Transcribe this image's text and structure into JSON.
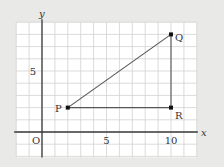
{
  "diagram": {
    "type": "coordinate-grid-triangle",
    "axes": {
      "x_label": "x",
      "y_label": "y",
      "origin_label": "O",
      "x_ticks": [
        {
          "value": 5,
          "label": "5"
        },
        {
          "value": 10,
          "label": "10"
        }
      ],
      "y_ticks": [
        {
          "value": 5,
          "label": "5"
        }
      ],
      "x_range": [
        -2,
        12
      ],
      "y_range": [
        -2,
        9
      ]
    },
    "points": [
      {
        "name": "P",
        "x": 2,
        "y": 2,
        "label_pos": "left"
      },
      {
        "name": "Q",
        "x": 10,
        "y": 8,
        "label_pos": "right"
      },
      {
        "name": "R",
        "x": 10,
        "y": 2,
        "label_pos": "right-below"
      }
    ],
    "segments": [
      {
        "from": "P",
        "to": "Q"
      },
      {
        "from": "Q",
        "to": "R"
      },
      {
        "from": "R",
        "to": "P"
      }
    ],
    "colors": {
      "background": "#e9e9e7",
      "grid_fill": "#ffffff",
      "grid_line": "#d2d2d2",
      "axis": "#3a3a3a",
      "segment": "#555555",
      "point": "#111111"
    }
  }
}
